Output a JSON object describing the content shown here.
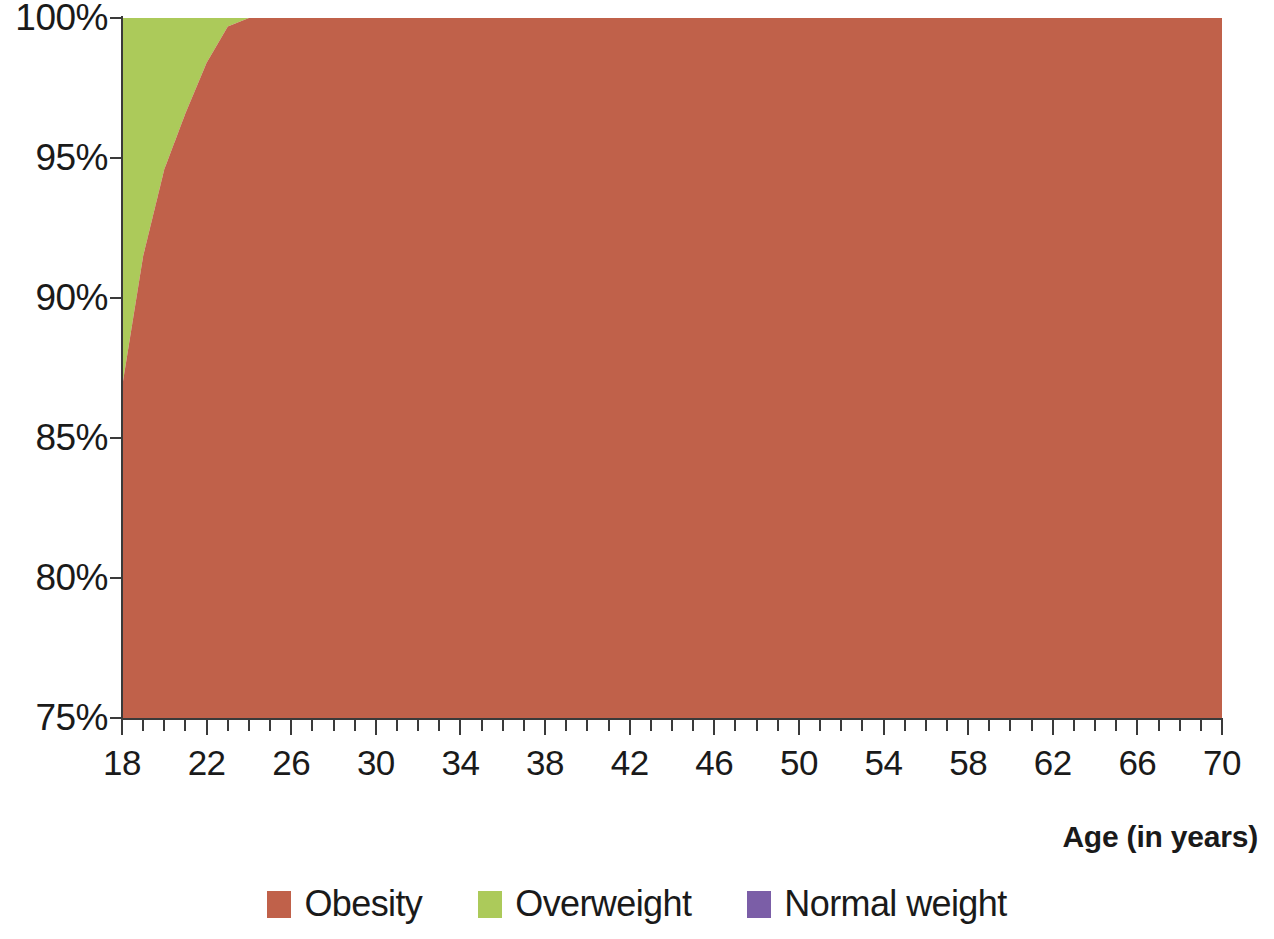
{
  "chart_data": {
    "type": "area",
    "stacked": true,
    "normalized_to_percent": true,
    "title": "",
    "subtitle": "",
    "xlabel": "Age (in years)",
    "ylabel": "",
    "xlim": [
      18,
      70
    ],
    "ylim": [
      75,
      100
    ],
    "ytick_labels": [
      "75%",
      "80%",
      "85%",
      "90%",
      "95%",
      "100%"
    ],
    "ytick_values": [
      75,
      80,
      85,
      90,
      95,
      100
    ],
    "xtick_labels": [
      "18",
      "22",
      "26",
      "30",
      "34",
      "38",
      "42",
      "46",
      "50",
      "54",
      "58",
      "62",
      "66",
      "70"
    ],
    "xtick_values": [
      18,
      22,
      26,
      30,
      34,
      38,
      42,
      46,
      50,
      54,
      58,
      62,
      66,
      70
    ],
    "xtick_minor_step": 1,
    "grid": false,
    "legend_position": "bottom",
    "legend": [
      "Obesity",
      "Overweight",
      "Normal weight"
    ],
    "colors": {
      "obesity": "#c0614a",
      "overweight": "#acca5a",
      "normal_weight": "#7b5ea7",
      "axis": "#3a3a3a",
      "text": "#1a1a1a",
      "background": "#ffffff"
    },
    "x": [
      18,
      19,
      20,
      21,
      22,
      23,
      24,
      26,
      30,
      34,
      38,
      42,
      46,
      50,
      54,
      58,
      62,
      66,
      70
    ],
    "series": [
      {
        "name": "Obesity",
        "color": "#c0614a",
        "values": [
          86.8,
          91.5,
          94.6,
          96.6,
          98.4,
          99.7,
          100,
          100,
          100,
          100,
          100,
          100,
          100,
          100,
          100,
          100,
          100,
          100,
          100
        ]
      },
      {
        "name": "Overweight",
        "color": "#acca5a",
        "values": [
          13.2,
          8.5,
          5.4,
          3.4,
          1.6,
          0.3,
          0,
          0,
          0,
          0,
          0,
          0,
          0,
          0,
          0,
          0,
          0,
          0,
          0
        ]
      },
      {
        "name": "Normal weight",
        "color": "#7b5ea7",
        "values": [
          0,
          0,
          0,
          0,
          0,
          0,
          0,
          0,
          0,
          0,
          0,
          0,
          0,
          0,
          0,
          0,
          0,
          0,
          0
        ]
      }
    ]
  },
  "axis": {
    "x_title": "Age (in years)"
  },
  "legend": {
    "items": [
      {
        "label": "Obesity",
        "color": "#c0614a"
      },
      {
        "label": "Overweight",
        "color": "#acca5a"
      },
      {
        "label": "Normal weight",
        "color": "#7b5ea7"
      }
    ]
  }
}
